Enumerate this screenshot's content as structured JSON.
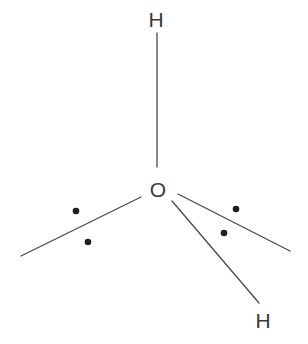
{
  "diagram": {
    "type": "molecular-structure",
    "atoms": [
      {
        "id": "H1",
        "label": "H",
        "x": 156,
        "y": 27
      },
      {
        "id": "O",
        "label": "O",
        "x": 158,
        "y": 197
      },
      {
        "id": "H2",
        "label": "H",
        "x": 263,
        "y": 328
      }
    ],
    "bonds": [
      {
        "id": "bond-O-H1",
        "x1": 157,
        "y1": 33,
        "x2": 157,
        "y2": 167
      },
      {
        "id": "lone-pair-left-line",
        "x1": 141,
        "y1": 197,
        "x2": 21,
        "y2": 256
      },
      {
        "id": "lone-pair-right-line",
        "x1": 178,
        "y1": 194,
        "x2": 290,
        "y2": 251
      },
      {
        "id": "bond-O-H2",
        "x1": 172,
        "y1": 201,
        "x2": 259,
        "y2": 303
      }
    ],
    "lone_pair_dots": [
      {
        "id": "dot-left-upper",
        "cx": 76,
        "cy": 211
      },
      {
        "id": "dot-left-lower",
        "cx": 88,
        "cy": 242
      },
      {
        "id": "dot-right-upper",
        "cx": 236,
        "cy": 209
      },
      {
        "id": "dot-right-lower",
        "cx": 224,
        "cy": 233
      }
    ],
    "colors": {
      "text": "#3a3a3a",
      "line": "#4a4a4a",
      "dot": "#1e1e1e",
      "background": "#ffffff"
    }
  }
}
